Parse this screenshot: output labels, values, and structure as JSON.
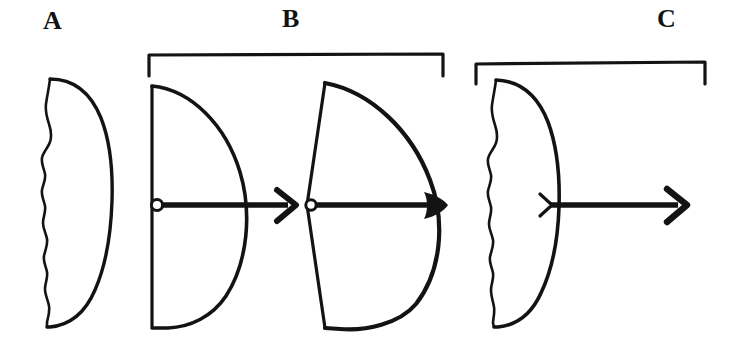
{
  "figure": {
    "type": "line-diagram",
    "background_color": "#ffffff",
    "ink_color": "#131313",
    "panels": [
      {
        "id": "A",
        "label": "A",
        "has_bracket": false,
        "items": [
          {
            "name": "crescent-wavy",
            "description": "lens/crescent outline with wavy left margin and smooth convex right margin",
            "arrow": false
          }
        ]
      },
      {
        "id": "B",
        "label": "B",
        "has_bracket": true,
        "items": [
          {
            "name": "d-shape",
            "description": "straight vertical left edge with smooth convex right arc",
            "arrow": true,
            "arrow_start_marker": "open-circle",
            "arrow_head": "open-chevron"
          },
          {
            "name": "fan-shape",
            "description": "two angled left edges meeting at a vertex with a wide convex right arc",
            "arrow": true,
            "arrow_start_marker": "open-circle",
            "arrow_head": "filled-blob"
          }
        ]
      },
      {
        "id": "C",
        "label": "C",
        "has_bracket": true,
        "items": [
          {
            "name": "crescent-wavy",
            "description": "lens/crescent outline with wavy left margin and smooth convex right margin",
            "arrow": true,
            "arrow_start_marker": "small-chevron",
            "arrow_head": "open-chevron"
          }
        ]
      }
    ]
  }
}
